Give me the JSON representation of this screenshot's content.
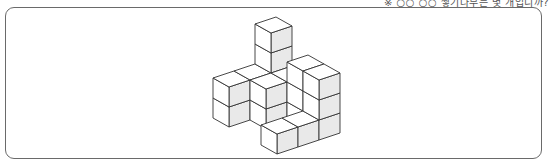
{
  "header": {
    "caption_partial": "※ ○○ ○○ 쌓기나무는 몇 개입니까?"
  },
  "figure": {
    "type": "isometric-cube-stack",
    "shade_color": "#e9e9e9",
    "edge_color": "#333333",
    "face_color": "#ffffff",
    "cubes": [
      {
        "x": 2,
        "y": 3,
        "z": 0
      },
      {
        "x": 2,
        "y": 3,
        "z": 1
      },
      {
        "x": 2,
        "y": 3,
        "z": 2
      },
      {
        "x": 2,
        "y": 3,
        "z": 3
      },
      {
        "x": 0,
        "y": 3,
        "z": 0
      },
      {
        "x": 0,
        "y": 3,
        "z": 1
      },
      {
        "x": 1,
        "y": 3,
        "z": 0
      },
      {
        "x": 1,
        "y": 3,
        "z": 1
      },
      {
        "x": 1,
        "y": 2,
        "z": 0
      },
      {
        "x": 1,
        "y": 2,
        "z": 1
      },
      {
        "x": 2,
        "y": 2,
        "z": 0
      },
      {
        "x": 2,
        "y": 2,
        "z": 1
      },
      {
        "x": 2,
        "y": 1,
        "z": 0
      },
      {
        "x": 2,
        "y": 1,
        "z": 1
      },
      {
        "x": 2,
        "y": 1,
        "z": 2
      },
      {
        "x": 0,
        "y": 0,
        "z": 0
      },
      {
        "x": 1,
        "y": 0,
        "z": 0
      },
      {
        "x": 2,
        "y": 0,
        "z": 0
      },
      {
        "x": 2,
        "y": 0,
        "z": 1
      },
      {
        "x": 2,
        "y": 0,
        "z": 2
      }
    ]
  }
}
